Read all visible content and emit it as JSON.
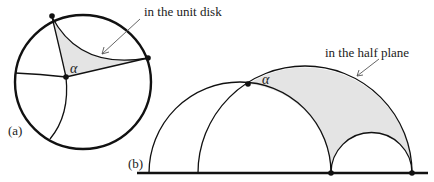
{
  "figure": {
    "panel_a": {
      "tag": "(a)",
      "annotation": "in the unit disk",
      "angle_label": "α",
      "fill_color": "#e4e4e4",
      "stroke_color": "#111111"
    },
    "panel_b": {
      "tag": "(b)",
      "annotation": "in the half plane",
      "angle_label": "α",
      "fill_color": "#e4e4e4",
      "stroke_color": "#111111"
    }
  }
}
